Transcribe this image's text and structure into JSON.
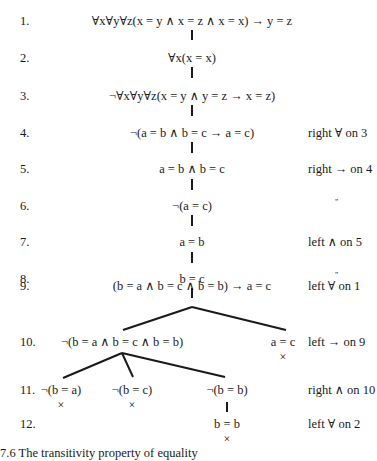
{
  "tree": {
    "rows": [
      {
        "num": "1.",
        "formula": "∀x∀y∀z(x = y ∧ x = z ∧ x = x) → y = z",
        "justification": ""
      },
      {
        "num": "2.",
        "formula": "∀x(x = x)",
        "justification": ""
      },
      {
        "num": "3.",
        "formula": "¬∀x∀y∀z(x = y ∧ y = z → x = z)",
        "justification": ""
      },
      {
        "num": "4.",
        "formula": "¬(a = b ∧ b = c → a = c)",
        "justification": "right ∀ on 3"
      },
      {
        "num": "5.",
        "formula": "a = b ∧ b = c",
        "justification": "right → on 4"
      },
      {
        "num": "6.",
        "formula": "¬(a = c)",
        "justification": "\""
      },
      {
        "num": "7.",
        "formula": "a = b",
        "justification": "left ∧ on 5"
      },
      {
        "num": "8.",
        "formula": "b = c",
        "justification": "\""
      },
      {
        "num": "9.",
        "formula": "(b = a ∧ b = c ∧ b = b) → a = c",
        "justification": "left ∀ on 1"
      },
      {
        "num": "10.",
        "formula_left": "¬(b = a ∧ b = c ∧ b = b)",
        "formula_right": "a = c",
        "justification": "left → on 9"
      },
      {
        "num": "11.",
        "formulas": [
          "¬(b = a)",
          "¬(b = c)",
          "¬(b = b)"
        ],
        "justification": "right ∧ on 10"
      },
      {
        "num": "12.",
        "formula": "b = b",
        "justification": "left ∀ on 2"
      }
    ],
    "closed_mark": "×"
  },
  "caption": "7.6   The transitivity property of equality"
}
